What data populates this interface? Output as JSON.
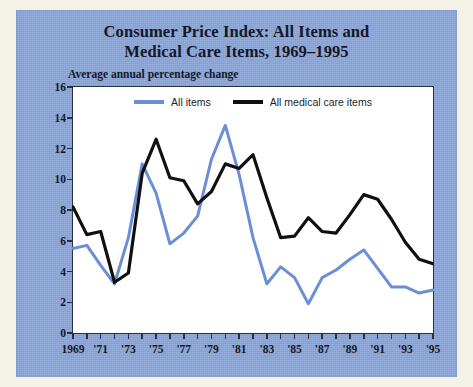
{
  "figure": {
    "title_line1": "Consumer Price Index: All Items and",
    "title_line2": "Medical Care Items, 1969–1995",
    "subtitle": "Average annual percentage change",
    "background_color": "#8ba6d8",
    "plot_background_color": "#ffffff",
    "border_color": "#2a2f45"
  },
  "chart_data": {
    "type": "line",
    "title": "Consumer Price Index: All Items and Medical Care Items, 1969–1995",
    "subtitle": "Average annual percentage change",
    "xlabel": "",
    "ylabel": "Average annual percentage change",
    "xlim": [
      1969,
      1995
    ],
    "ylim": [
      0,
      16
    ],
    "ytick_step": 2,
    "grid": false,
    "legend_position": "top-center",
    "x": [
      1969,
      1970,
      1971,
      1972,
      1973,
      1974,
      1975,
      1976,
      1977,
      1978,
      1979,
      1980,
      1981,
      1982,
      1983,
      1984,
      1985,
      1986,
      1987,
      1988,
      1989,
      1990,
      1991,
      1992,
      1993,
      1994,
      1995
    ],
    "xticks": [
      1969,
      1970,
      1971,
      1972,
      1973,
      1974,
      1975,
      1976,
      1977,
      1978,
      1979,
      1980,
      1981,
      1982,
      1983,
      1984,
      1985,
      1986,
      1987,
      1988,
      1989,
      1990,
      1991,
      1992,
      1993,
      1994,
      1995
    ],
    "xticklabels": [
      "1969",
      "",
      "'71",
      "",
      "'73",
      "",
      "'75",
      "",
      "'77",
      "",
      "'79",
      "",
      "'81",
      "",
      "'83",
      "",
      "'85",
      "",
      "'87",
      "",
      "'89",
      "",
      "'91",
      "",
      "'93",
      "",
      "'95"
    ],
    "yticks": [
      0,
      2,
      4,
      6,
      8,
      10,
      12,
      14,
      16
    ],
    "yticklabels": [
      "0",
      "2",
      "4",
      "6",
      "8",
      "10",
      "12",
      "14",
      "16"
    ],
    "series": [
      {
        "name": "All items",
        "color": "#6b8ed6",
        "values": [
          5.5,
          5.7,
          4.4,
          3.2,
          6.2,
          11.0,
          9.1,
          5.8,
          6.5,
          7.6,
          11.3,
          13.5,
          10.3,
          6.2,
          3.2,
          4.3,
          3.6,
          1.9,
          3.6,
          4.1,
          4.8,
          5.4,
          4.2,
          3.0,
          3.0,
          2.6,
          2.8
        ]
      },
      {
        "name": "All medical care items",
        "color": "#101010",
        "values": [
          8.2,
          6.4,
          6.6,
          3.3,
          3.9,
          10.4,
          12.6,
          10.1,
          9.9,
          8.4,
          9.2,
          11.0,
          10.7,
          11.6,
          8.8,
          6.2,
          6.3,
          7.5,
          6.6,
          6.5,
          7.7,
          9.0,
          8.7,
          7.4,
          5.9,
          4.8,
          4.5
        ]
      }
    ]
  },
  "legend": {
    "items": [
      {
        "label": "All items",
        "color": "#6b8ed6"
      },
      {
        "label": "All medical care items",
        "color": "#101010"
      }
    ]
  }
}
